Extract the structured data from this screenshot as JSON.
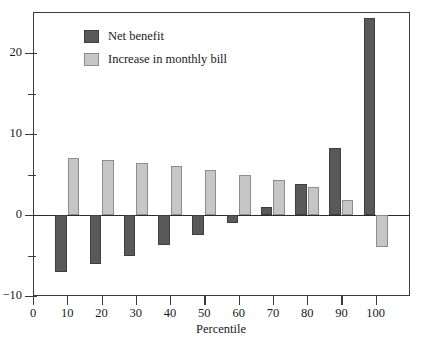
{
  "chart_data": {
    "type": "bar",
    "title": "",
    "subtitle": "",
    "xlabel": "Percentile",
    "ylabel": "",
    "categories": [
      "10",
      "20",
      "30",
      "40",
      "50",
      "60",
      "70",
      "80",
      "90",
      "100"
    ],
    "series": [
      {
        "name": "Net benefit",
        "color": "#595959",
        "values": [
          -7.0,
          -6.1,
          -5.0,
          -3.7,
          -2.5,
          -1.0,
          1.0,
          3.8,
          8.3,
          24.3
        ]
      },
      {
        "name": "Increase in monthly bill",
        "color": "#c6c6c6",
        "values": [
          7.0,
          6.8,
          6.4,
          6.0,
          5.6,
          5.0,
          4.3,
          3.4,
          1.9,
          -4.0
        ]
      }
    ],
    "ylim": [
      -10,
      26
    ],
    "yticks_major": [
      -10,
      0,
      10,
      20
    ],
    "yticks_minor": [
      -5,
      5,
      15
    ],
    "ytick_labels": [
      "−10",
      "0",
      "10",
      "20"
    ],
    "xlim": [
      0,
      110
    ],
    "xticks": [
      0,
      10,
      20,
      30,
      40,
      50,
      60,
      70,
      80,
      90,
      100
    ],
    "xtick_labels": [
      "0",
      "10",
      "20",
      "30",
      "40",
      "50",
      "60",
      "70",
      "80",
      "90",
      "100"
    ],
    "grid": false,
    "legend_position": "top-left",
    "zero_line": true
  },
  "legend": {
    "items": [
      {
        "label": "Net benefit",
        "swatch": "net"
      },
      {
        "label": "Increase in monthly bill",
        "swatch": "bill"
      }
    ]
  },
  "axis": {
    "x_title": "Percentile"
  }
}
